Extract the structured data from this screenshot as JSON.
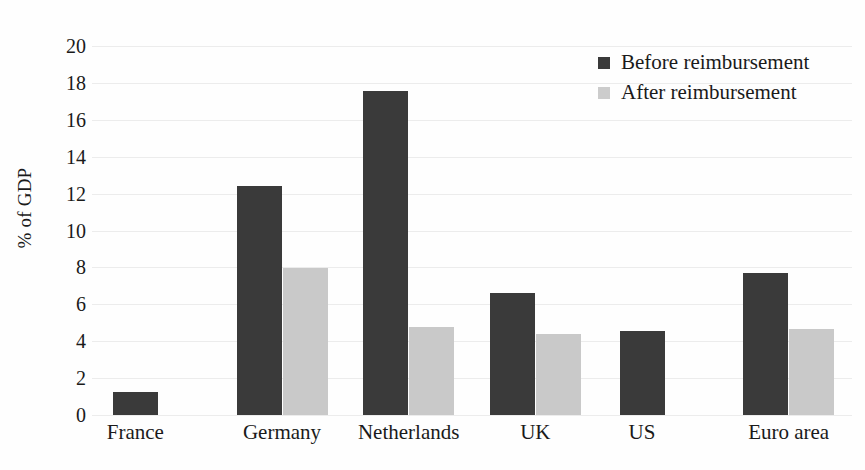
{
  "chart_data": {
    "type": "bar",
    "title": "",
    "xlabel": "",
    "ylabel": "% of GDP",
    "ylim": [
      0,
      20
    ],
    "ytick_step": 2,
    "yticks": [
      0,
      2,
      4,
      6,
      8,
      10,
      12,
      14,
      16,
      18,
      20
    ],
    "ytick_labels": [
      "0",
      "2",
      "4",
      "6",
      "8",
      "10",
      "12",
      "14",
      "16",
      "18",
      "20"
    ],
    "grid": true,
    "grid_axis": "y",
    "legend_position": "top-right",
    "categories": [
      "France",
      "Germany",
      "Netherlands",
      "UK",
      "US",
      "Euro area"
    ],
    "series": [
      {
        "name": "Before reimbursement",
        "color": "#3a3a3a",
        "values": [
          1.25,
          12.4,
          17.55,
          6.6,
          4.55,
          7.7
        ]
      },
      {
        "name": "After reimbursement",
        "color": "#c9c9c9",
        "values": [
          null,
          7.95,
          4.75,
          4.4,
          null,
          4.65
        ]
      }
    ]
  },
  "legend": {
    "items": [
      {
        "label": "Before reimbursement",
        "swatch": "before"
      },
      {
        "label": "After reimbursement",
        "swatch": "after"
      }
    ]
  }
}
